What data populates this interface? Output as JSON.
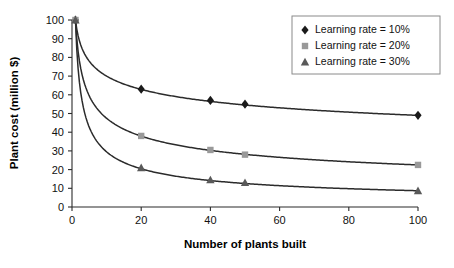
{
  "chart_data": {
    "type": "line",
    "title": "",
    "xlabel": "Number of plants built",
    "ylabel": "Plant cost (million $)",
    "xlim": [
      0,
      100
    ],
    "ylim": [
      0,
      100
    ],
    "xticks": [
      "0",
      "20",
      "40",
      "60",
      "80",
      "100"
    ],
    "yticks": [
      "0",
      "10",
      "20",
      "30",
      "40",
      "50",
      "60",
      "70",
      "80",
      "90",
      "100"
    ],
    "grid": false,
    "legend_position": "top-right",
    "x": [
      1,
      20,
      40,
      50,
      100
    ],
    "series": [
      {
        "name": "Learning rate = 10%",
        "marker": "diamond",
        "color": "#1a1a1a",
        "values": [
          100,
          63,
          57,
          55,
          49
        ]
      },
      {
        "name": "Learning rate = 20%",
        "marker": "square",
        "color": "#999999",
        "values": [
          100,
          38,
          30.5,
          28,
          22.5
        ]
      },
      {
        "name": "Learning rate = 30%",
        "marker": "triangle",
        "color": "#595959",
        "values": [
          100,
          21,
          14.5,
          13,
          8.7
        ]
      }
    ]
  },
  "legend": {
    "entries": [
      {
        "label": "Learning rate = 10%"
      },
      {
        "label": "Learning rate = 20%"
      },
      {
        "label": "Learning rate = 30%"
      }
    ]
  }
}
